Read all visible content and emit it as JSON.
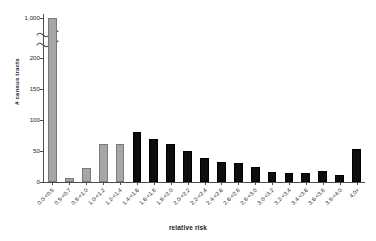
{
  "chart_data": {
    "type": "bar",
    "title": "",
    "xlabel": "relative risk",
    "ylabel": "# census tracts",
    "ylim": [
      0,
      200
    ],
    "grid": false,
    "legend": "none",
    "axis_break": {
      "present": true,
      "below": 200,
      "above": 1000,
      "note": "broken y-axis between 200 and 1,000"
    },
    "ytick_labels": [
      "0",
      "50",
      "100",
      "150",
      "200",
      "1,000"
    ],
    "categories": [
      "0.0-<0.5",
      "0.5-<0.7",
      "0.8-<1.0",
      "1.0-<1.2",
      "1.2-<1.4",
      "1.4-<1.6",
      "1.6-<1.8",
      "1.8-<2.0",
      "2.0-<2.2",
      "2.2-<2.4",
      "2.4-<2.6",
      "2.6-<2.8",
      "2.8-<3.0",
      "3.0-<3.2",
      "3.2-<3.4",
      "3.4-<3.6",
      "3.6-<3.8",
      "3.8-<4.0",
      "4.0+"
    ],
    "values": [
      960,
      6,
      23,
      61,
      61,
      80,
      70,
      61,
      50,
      38,
      33,
      30,
      24,
      16,
      14,
      14,
      17,
      11,
      54
    ],
    "bar_colors": [
      "#a6a6a6",
      "#a6a6a6",
      "#a6a6a6",
      "#a6a6a6",
      "#a6a6a6",
      "#0d0d0d",
      "#0d0d0d",
      "#0d0d0d",
      "#0d0d0d",
      "#0d0d0d",
      "#0d0d0d",
      "#0d0d0d",
      "#0d0d0d",
      "#0d0d0d",
      "#0d0d0d",
      "#0d0d0d",
      "#0d0d0d",
      "#0d0d0d",
      "#0d0d0d"
    ],
    "colors": {
      "gray_series": "#a6a6a6",
      "black_series": "#0d0d0d",
      "axis": "#4d4d4d",
      "text": "#262626",
      "background": "#ffffff"
    }
  }
}
